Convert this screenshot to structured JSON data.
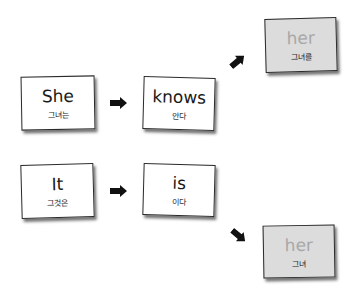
{
  "diagram": {
    "row1": {
      "subject": {
        "en": "She",
        "ko": "그녀는"
      },
      "verb": {
        "en": "knows",
        "ko": "안다"
      },
      "object": {
        "en": "her",
        "ko": "그녀를"
      }
    },
    "row2": {
      "subject": {
        "en": "It",
        "ko": "그것은"
      },
      "verb": {
        "en": "is",
        "ko": "이다"
      },
      "complement": {
        "en": "her",
        "ko": "그녀"
      }
    },
    "icons": {
      "arrow_right": "arrow-right-icon",
      "arrow_up_right": "arrow-up-right-icon",
      "arrow_down_right": "arrow-down-right-icon"
    },
    "colors": {
      "card_white": "#ffffff",
      "card_gray": "#dcdcdc",
      "border": "#2a2a2a",
      "gray_text": "#a8a8a8",
      "arrow": "#111111"
    }
  }
}
